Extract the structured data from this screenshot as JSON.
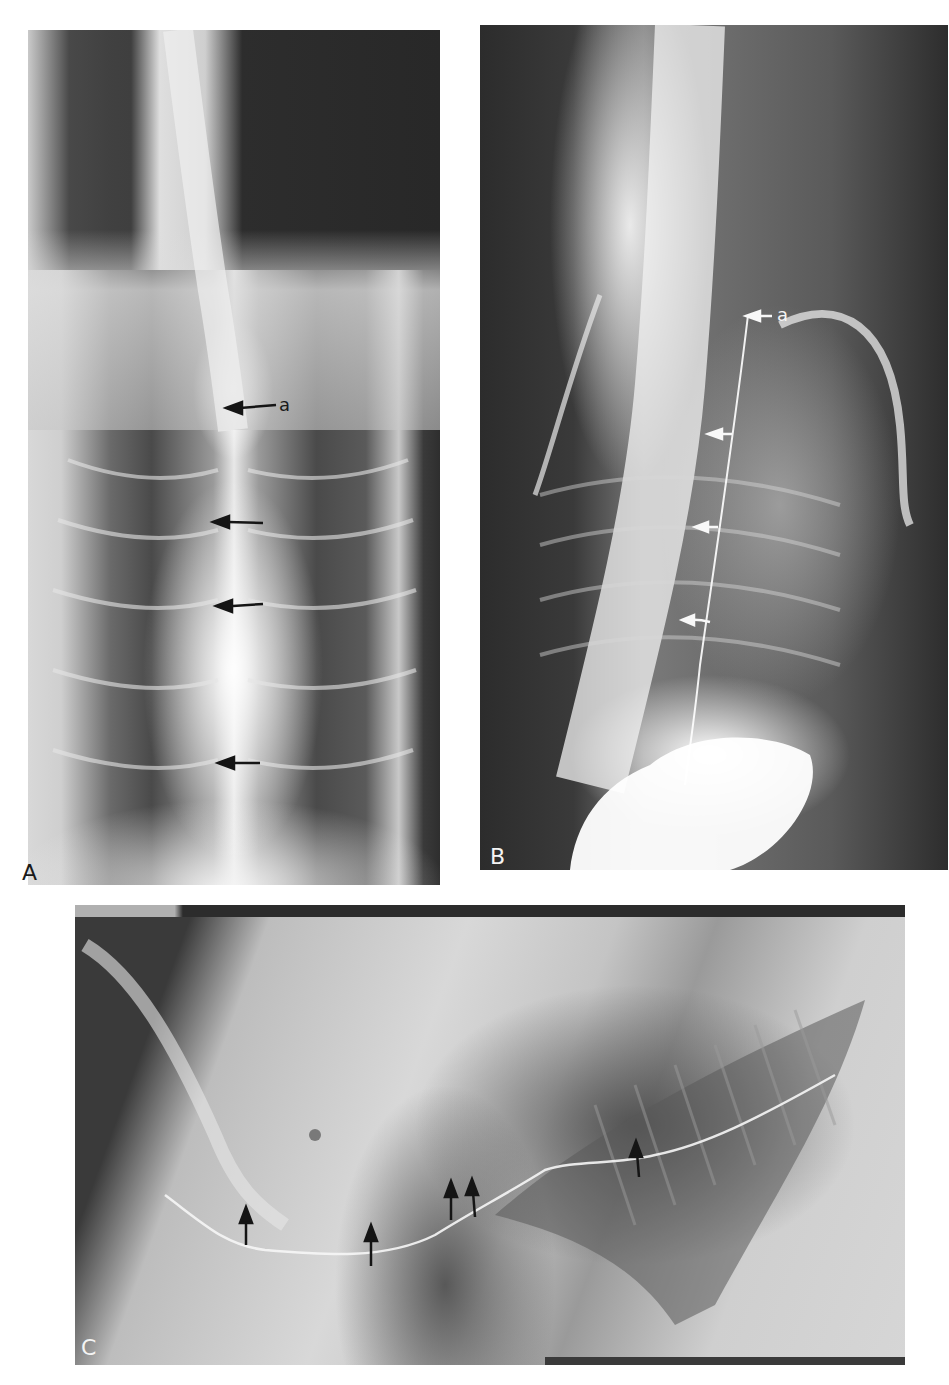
{
  "figure": {
    "panels": [
      {
        "id": "A",
        "label": "A",
        "view": "ventrodorsal radiograph",
        "annotations": [
          {
            "type": "labeled-arrow",
            "text": "a",
            "direction": "left",
            "color": "#1a1a1a"
          },
          {
            "type": "arrow",
            "direction": "left",
            "color": "#1a1a1a"
          },
          {
            "type": "arrow",
            "direction": "left",
            "color": "#1a1a1a"
          },
          {
            "type": "arrow",
            "direction": "left",
            "color": "#1a1a1a"
          }
        ]
      },
      {
        "id": "B",
        "label": "B",
        "view": "lateral radiograph",
        "annotations": [
          {
            "type": "labeled-arrow",
            "text": "a",
            "direction": "left",
            "color": "#f4f4f4"
          },
          {
            "type": "arrow",
            "direction": "left",
            "color": "#f4f4f4"
          },
          {
            "type": "arrow",
            "direction": "left",
            "color": "#f4f4f4"
          },
          {
            "type": "arrow",
            "direction": "left",
            "color": "#f4f4f4"
          }
        ]
      },
      {
        "id": "C",
        "label": "C",
        "view": "lateral radiograph",
        "annotations": [
          {
            "type": "arrow",
            "direction": "up",
            "color": "#1a1a1a"
          },
          {
            "type": "arrow",
            "direction": "up",
            "color": "#1a1a1a"
          },
          {
            "type": "arrow",
            "direction": "up",
            "color": "#1a1a1a"
          },
          {
            "type": "arrow",
            "direction": "up",
            "color": "#1a1a1a"
          },
          {
            "type": "arrow",
            "direction": "up",
            "color": "#1a1a1a"
          }
        ]
      }
    ]
  }
}
